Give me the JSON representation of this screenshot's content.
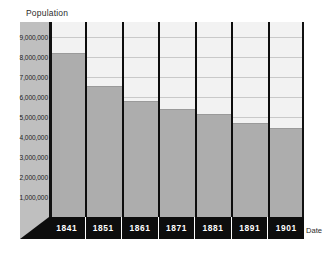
{
  "chart_data": {
    "type": "bar",
    "title": "",
    "xlabel": "Date",
    "ylabel": "Population",
    "categories": [
      "1841",
      "1851",
      "1861",
      "1871",
      "1881",
      "1891",
      "1901"
    ],
    "values": [
      8200000,
      6550000,
      5800000,
      5400000,
      5150000,
      4700000,
      4450000
    ],
    "series": [
      {
        "name": "Population",
        "values": [
          8200000,
          6550000,
          5800000,
          5400000,
          5150000,
          4700000,
          4450000
        ]
      }
    ],
    "ylim": [
      0,
      9750000
    ],
    "ytick_values": [
      9000000,
      8000000,
      7000000,
      6000000,
      5000000,
      4000000,
      3000000,
      2000000,
      1000000
    ],
    "ytick_labels": [
      "9,000,000",
      "8,000,000",
      "7,000,000",
      "6,000,000",
      "5,000,000",
      "4,000,000",
      "3,000,000",
      "2,000,000",
      "1,000,000"
    ],
    "grid": true,
    "legend": false,
    "legend_position": "none",
    "bar_color": "#adadad",
    "plot_background": "#f2f2f2",
    "axis_color": "#0d0d0d",
    "gridline_color": "#c9c9c9",
    "label_band_color": "#bfbfbf"
  },
  "caption": {
    "label": "",
    "text": ""
  }
}
